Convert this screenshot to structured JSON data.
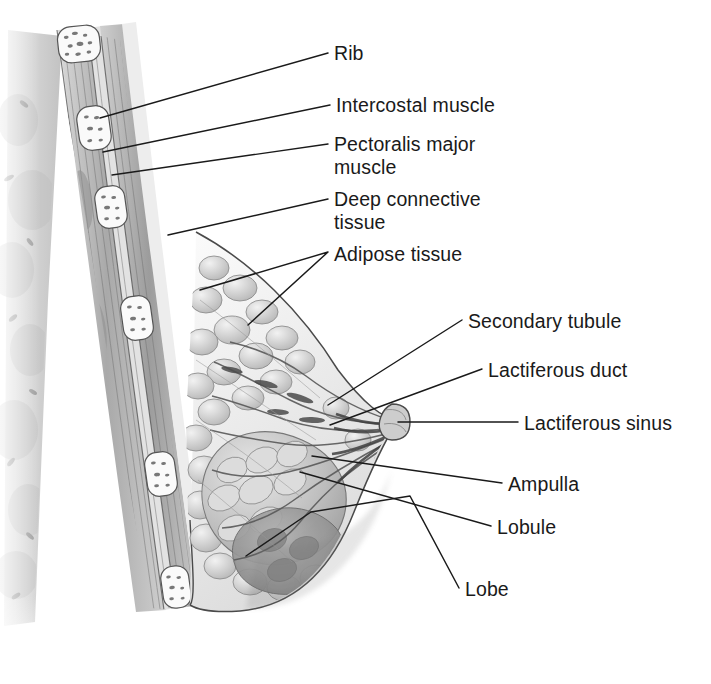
{
  "figure": {
    "type": "anatomical-illustration",
    "style": "grayscale pencil/airbrush medical illustration",
    "background_color": "#ffffff",
    "ink_color": "#1a1a1a",
    "label_font_size_px": 19.5
  },
  "labels": [
    {
      "id": "rib",
      "text": "Rib",
      "x": 334,
      "y": 42,
      "lines": [
        "Rib"
      ]
    },
    {
      "id": "intercostal-muscle",
      "text": "Intercostal muscle",
      "x": 336,
      "y": 94,
      "lines": [
        "Intercostal muscle"
      ]
    },
    {
      "id": "pectoralis-major",
      "text": "Pectoralis major muscle",
      "x": 334,
      "y": 133,
      "lines": [
        "Pectoralis major",
        "muscle"
      ]
    },
    {
      "id": "deep-connective",
      "text": "Deep connective tissue",
      "x": 334,
      "y": 188,
      "lines": [
        "Deep connective",
        "tissue"
      ]
    },
    {
      "id": "adipose-tissue",
      "text": "Adipose tissue",
      "x": 334,
      "y": 243,
      "lines": [
        "Adipose tissue"
      ]
    },
    {
      "id": "secondary-tubule",
      "text": "Secondary tubule",
      "x": 468,
      "y": 310,
      "lines": [
        "Secondary tubule"
      ]
    },
    {
      "id": "lactiferous-duct",
      "text": "Lactiferous duct",
      "x": 488,
      "y": 359,
      "lines": [
        "Lactiferous duct"
      ]
    },
    {
      "id": "lactiferous-sinus",
      "text": "Lactiferous sinus",
      "x": 524,
      "y": 412,
      "lines": [
        "Lactiferous sinus"
      ]
    },
    {
      "id": "ampulla",
      "text": "Ampulla",
      "x": 508,
      "y": 473,
      "lines": [
        "Ampulla"
      ]
    },
    {
      "id": "lobule",
      "text": "Lobule",
      "x": 497,
      "y": 516,
      "lines": [
        "Lobule"
      ]
    },
    {
      "id": "lobe",
      "text": "Lobe",
      "x": 465,
      "y": 578,
      "lines": [
        "Lobe"
      ]
    }
  ],
  "leaders": [
    {
      "id": "rib",
      "path": "M328 53 L100 118"
    },
    {
      "id": "intercostal-muscle",
      "path": "M330 105 L103 152"
    },
    {
      "id": "pectoralis-major",
      "path": "M328 144 L112 175"
    },
    {
      "id": "deep-connective",
      "path": "M328 199 L168 235"
    },
    {
      "id": "adipose-tissue",
      "path": "M328 252 L200 290 M328 252 L248 325"
    },
    {
      "id": "secondary-tubule",
      "path": "M462 320 L328 405"
    },
    {
      "id": "lactiferous-duct",
      "path": "M482 369 L330 425"
    },
    {
      "id": "lactiferous-sinus",
      "path": "M518 422 L398 422"
    },
    {
      "id": "ampulla",
      "path": "M502 483 L312 456"
    },
    {
      "id": "lobule",
      "path": "M491 526 L300 472"
    },
    {
      "id": "lobe",
      "path": "M459 588 L410 496 L311 512 L246 556"
    }
  ],
  "anatomy_regions": [
    {
      "id": "lung-chest-cavity",
      "name": "Chest cavity / lung tissue"
    },
    {
      "id": "rib-cross-sections",
      "name": "Rib cross sections",
      "count": 5
    },
    {
      "id": "intercostal-layer",
      "name": "Intercostal muscle layer"
    },
    {
      "id": "pectoralis-layer",
      "name": "Pectoralis major muscle layer"
    },
    {
      "id": "deep-fascia",
      "name": "Deep connective tissue / fascia"
    },
    {
      "id": "adipose-lobules",
      "name": "Adipose tissue lobules"
    },
    {
      "id": "glandular-lobe",
      "name": "Glandular lobe (dark mass)"
    },
    {
      "id": "duct-system",
      "name": "Lactiferous duct system converging at nipple"
    },
    {
      "id": "nipple-areola",
      "name": "Nipple and areola"
    },
    {
      "id": "skin-contour",
      "name": "Skin outline of breast"
    },
    {
      "id": "inframammary-fold",
      "name": "Inframammary fold"
    }
  ]
}
